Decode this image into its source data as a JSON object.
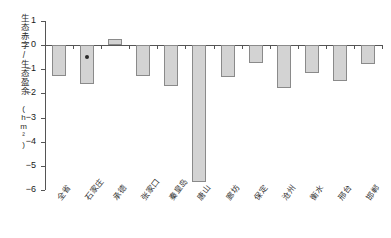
{
  "chart_data": {
    "type": "bar",
    "title": "",
    "xlabel": "",
    "ylabel": "生态赤字/生态盈余",
    "yunit": "(hm²)",
    "ylim": [
      -6,
      1
    ],
    "yticks": [
      1,
      0,
      -1,
      -2,
      -3,
      -4,
      -5,
      -6
    ],
    "ytick_labels": [
      "1",
      "0",
      "−1",
      "−2",
      "−3",
      "−4",
      "−5",
      "−6"
    ],
    "grid": false,
    "legend": "none",
    "categories": [
      "全省",
      "石家庄",
      "承德",
      "张家口",
      "秦皇岛",
      "唐山",
      "廊坊",
      "保定",
      "沧州",
      "衡水",
      "邢台",
      "邯郸"
    ],
    "values": [
      -1.27,
      -1.62,
      0.25,
      -1.28,
      -1.68,
      -5.68,
      -1.3,
      -0.72,
      -1.78,
      -1.15,
      -1.48,
      -0.78
    ],
    "annotations": [
      {
        "category": "石家庄",
        "marker": "filled-circle",
        "value": -0.5
      }
    ]
  }
}
